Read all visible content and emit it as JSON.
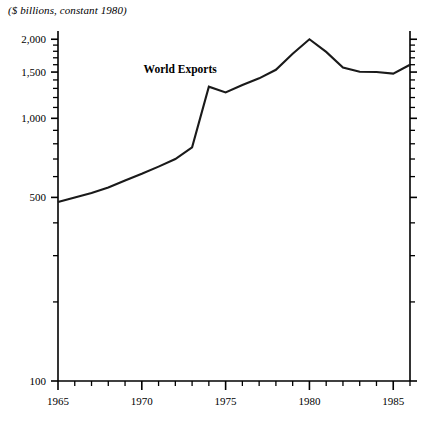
{
  "figure": {
    "axis_note": "($ billions, constant 1980)",
    "series_label": "World Exports",
    "line_color": "#1a1a1a",
    "axis_color": "#000000",
    "background": "#ffffff"
  },
  "chart_data": {
    "type": "line",
    "title": "",
    "subtitle": "",
    "xlabel": "",
    "ylabel": "($ billions, constant 1980)",
    "yscale": "log",
    "ylim": [
      100,
      2150
    ],
    "xlim": [
      1965,
      1986
    ],
    "grid": false,
    "legend": "none",
    "ytick_labels": [
      "100",
      "500",
      "1,000",
      "1,500",
      "2,000"
    ],
    "ytick_values": [
      100,
      500,
      1000,
      1500,
      2000
    ],
    "yminor_values": [
      200,
      300,
      400,
      600,
      700,
      800,
      900,
      1100,
      1200,
      1300,
      1400,
      1600,
      1700,
      1800,
      1900
    ],
    "xtick_labels": [
      "1965",
      "1970",
      "1975",
      "1980",
      "1985"
    ],
    "xtick_values": [
      1965,
      1970,
      1975,
      1980,
      1985
    ],
    "xminor_step": 1,
    "series": [
      {
        "name": "World Exports",
        "x": [
          1965,
          1966,
          1967,
          1968,
          1969,
          1970,
          1971,
          1972,
          1973,
          1974,
          1975,
          1976,
          1977,
          1978,
          1979,
          1980,
          1981,
          1982,
          1983,
          1984,
          1985,
          1986
        ],
        "values": [
          480,
          500,
          520,
          545,
          580,
          615,
          655,
          700,
          775,
          1320,
          1255,
          1340,
          1420,
          1530,
          1760,
          2000,
          1790,
          1560,
          1505,
          1500,
          1480,
          1600
        ]
      }
    ],
    "annotations": [
      {
        "text": "World Exports",
        "x": 1974.4,
        "y": 1520
      },
      {
        "text": "($ billions, constant 1980)",
        "x": 1965,
        "y": 2150
      }
    ]
  }
}
